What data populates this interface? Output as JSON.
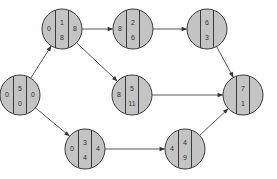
{
  "diagram": {
    "type": "activity-network",
    "colors": {
      "node_fill": "#c4c4c4",
      "node_stroke": "#3a3a3a",
      "edge": "#444444",
      "text": "#333333"
    },
    "nodes": [
      {
        "id": "n1",
        "cx": 20,
        "cy": 95,
        "left": "0",
        "top": "5",
        "bottom": "0",
        "right": "0"
      },
      {
        "id": "n2",
        "cx": 62,
        "cy": 29,
        "left": "0",
        "top": "1",
        "bottom": "8",
        "right": "8"
      },
      {
        "id": "n3",
        "cx": 133,
        "cy": 29,
        "left": "8",
        "top": "2",
        "bottom": "6",
        "right": ""
      },
      {
        "id": "n4",
        "cx": 207,
        "cy": 29,
        "left": "",
        "top": "6",
        "bottom": "3",
        "right": ""
      },
      {
        "id": "n5",
        "cx": 132,
        "cy": 95,
        "left": "8",
        "top": "5",
        "bottom": "11",
        "right": ""
      },
      {
        "id": "n6",
        "cx": 243,
        "cy": 95,
        "left": "",
        "top": "7",
        "bottom": "1",
        "right": ""
      },
      {
        "id": "n7",
        "cx": 85,
        "cy": 149,
        "left": "0",
        "top": "3",
        "bottom": "4",
        "right": "4"
      },
      {
        "id": "n8",
        "cx": 185,
        "cy": 149,
        "left": "4",
        "top": "4",
        "bottom": "9",
        "right": ""
      }
    ],
    "edges": [
      {
        "from": "n1",
        "to": "n2"
      },
      {
        "from": "n2",
        "to": "n3"
      },
      {
        "from": "n3",
        "to": "n4"
      },
      {
        "from": "n2",
        "to": "n5"
      },
      {
        "from": "n4",
        "to": "n6"
      },
      {
        "from": "n5",
        "to": "n6"
      },
      {
        "from": "n1",
        "to": "n7"
      },
      {
        "from": "n7",
        "to": "n8"
      },
      {
        "from": "n8",
        "to": "n6"
      }
    ]
  }
}
